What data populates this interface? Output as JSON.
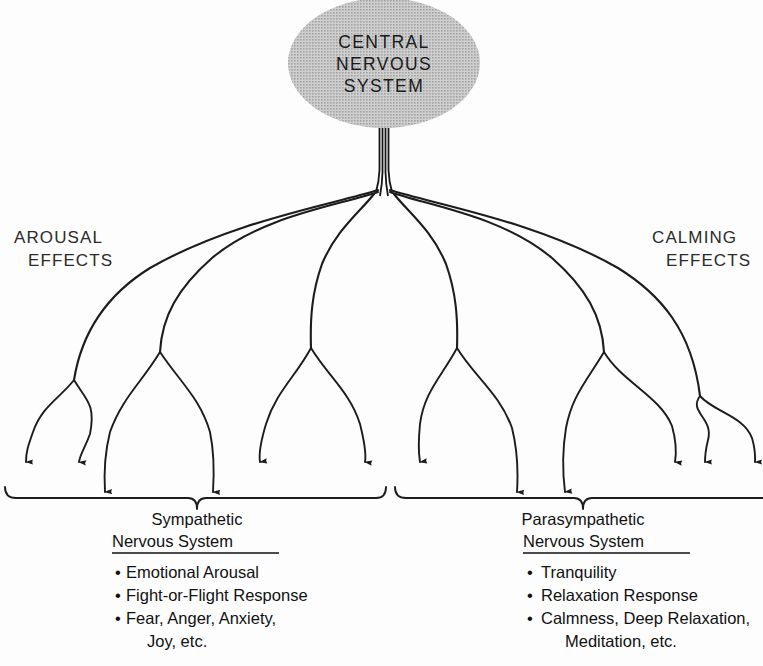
{
  "diagram": {
    "title_node": {
      "label_lines": [
        "CENTRAL",
        "NERVOUS",
        "SYSTEM"
      ],
      "shape": "ellipse",
      "fill_color": "#b9b9b9"
    },
    "left_label": {
      "line1": "AROUSAL",
      "line2": "EFFECTS"
    },
    "right_label": {
      "line1": "CALMING",
      "line2": "EFFECTS"
    },
    "left_block": {
      "title_line1": "Sympathetic",
      "title_line2": "Nervous System",
      "items": [
        {
          "bullet": "•",
          "text": "Emotional Arousal"
        },
        {
          "bullet": "•",
          "text": "Fight-or-Flight Response"
        },
        {
          "bullet": "•",
          "text": "Fear, Anger, Anxiety,"
        },
        {
          "bullet": "",
          "text": "Joy, etc."
        }
      ]
    },
    "right_block": {
      "title_line1": "Parasympathetic",
      "title_line2": "Nervous System",
      "items": [
        {
          "bullet": "•",
          "text": "Tranquility"
        },
        {
          "bullet": "•",
          "text": "Relaxation Response"
        },
        {
          "bullet": "•",
          "text": "Calmness, Deep Relaxation,"
        },
        {
          "bullet": "",
          "text": "Meditation, etc."
        }
      ]
    },
    "colors": {
      "ink": "#1c1c1c",
      "node_fill": "#b9b9b9",
      "background": "#fdfdfd"
    },
    "counts": {
      "left_arrows": 6,
      "right_arrows": 6,
      "left_branches": 3,
      "right_branches": 3
    }
  }
}
